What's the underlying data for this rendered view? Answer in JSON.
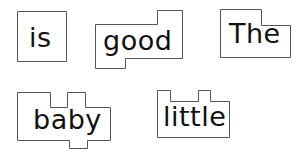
{
  "colors": {
    "background": "#ffffff",
    "outline": "#555555",
    "text": "#111111"
  },
  "cards": [
    {
      "word": "is",
      "x": 17,
      "y": 11,
      "w": 49,
      "h": 50,
      "outline": "0,0 49,0 49,50 0,50",
      "text_x": 12,
      "text_y": 13
    },
    {
      "word": "good",
      "x": 95,
      "y": 10,
      "w": 87,
      "h": 58,
      "outline": "0,14 62,14 62,0 87,0 87,48 30,48 30,58 0,58",
      "text_x": 8,
      "text_y": 17
    },
    {
      "word": "The",
      "x": 220,
      "y": 9,
      "w": 70,
      "h": 48,
      "outline": "0,0 41,0 41,16 70,16 70,48 0,48",
      "text_x": 9,
      "text_y": 11
    },
    {
      "word": "baby",
      "x": 17,
      "y": 92,
      "w": 93,
      "h": 56,
      "outline": "0,0 33,0 33,15 50,15 50,0 68,0 68,15 93,15 93,48 70,48 70,56 52,56 52,48 0,48",
      "text_x": 16,
      "text_y": 14
    },
    {
      "word": "little",
      "x": 157,
      "y": 90,
      "w": 72,
      "h": 47,
      "outline": "0,0 13,0 13,11 41,11 41,0 53,0 53,11 72,11 72,47 0,47",
      "text_x": 6,
      "text_y": 13
    }
  ]
}
